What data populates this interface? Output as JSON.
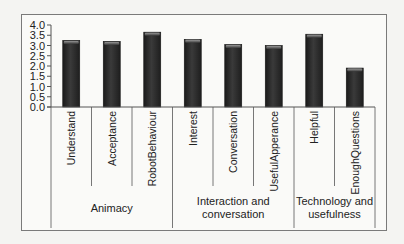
{
  "chart_data": {
    "type": "bar",
    "title": "",
    "xlabel": "",
    "ylabel": "",
    "ylim": [
      0,
      4.0
    ],
    "ytick_step": 0.5,
    "yticks": [
      "0.0",
      "0.5",
      "1.0",
      "1.5",
      "2.0",
      "2.5",
      "3.0",
      "3.5",
      "4.0"
    ],
    "grid": false,
    "legend": "none",
    "categories": [
      "Understand",
      "Acceptance",
      "RobotBehaviour",
      "Interest",
      "Conversation",
      "UsefulApperance",
      "Helpful",
      "EnoughQuestions"
    ],
    "values": [
      3.25,
      3.2,
      3.65,
      3.3,
      3.05,
      3.0,
      3.55,
      1.9
    ],
    "groups": [
      {
        "label_lines": [
          "Animacy"
        ],
        "start": 0,
        "end": 2
      },
      {
        "label_lines": [
          "Interaction and",
          "conversation"
        ],
        "start": 3,
        "end": 5
      },
      {
        "label_lines": [
          "Technology and",
          "usefulness"
        ],
        "start": 6,
        "end": 7
      }
    ],
    "colors": {
      "bar": "#2b2b2b",
      "bar_highlight": "#8a8a8a",
      "axis": "#555555"
    }
  }
}
